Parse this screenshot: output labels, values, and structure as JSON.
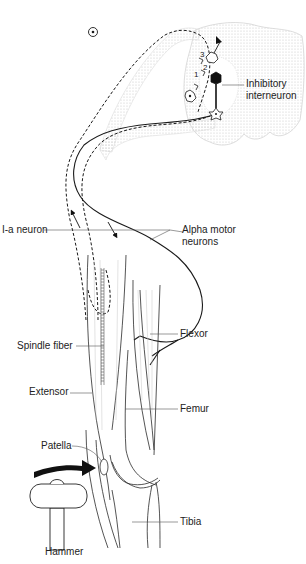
{
  "figure": {
    "labels": {
      "inhibitory_interneuron": "Inhibitory\ninterneuron",
      "ia_neuron": "I-a neuron",
      "alpha_motor_neurons": "Alpha motor\nneurons",
      "spindle_fiber": "Spindle fiber",
      "flexor": "Flexor",
      "extensor": "Extensor",
      "femur": "Femur",
      "patella": "Patella",
      "tibia": "Tibia",
      "hammer": "Hammer"
    },
    "synapse_numbers": [
      "1",
      "2",
      "3"
    ],
    "colors": {
      "line": "#1a1a1a",
      "spinal_cord_stipple": "#c8c8c8",
      "muscle_hatch": "#bdbdbd",
      "arrow": "#111111"
    }
  }
}
